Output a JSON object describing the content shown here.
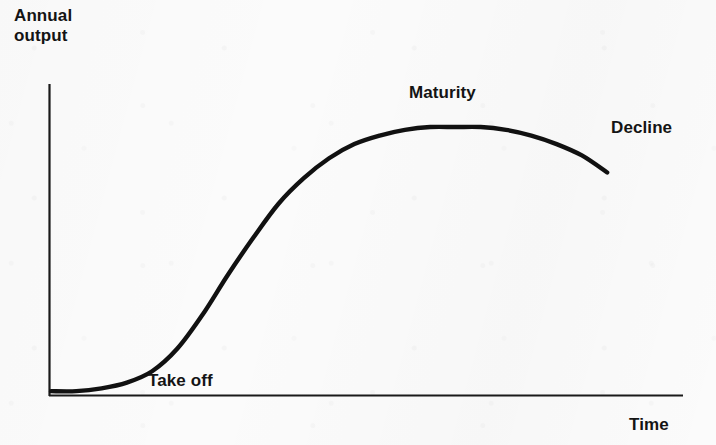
{
  "chart_data": {
    "type": "line",
    "title": "",
    "subtitle": "",
    "xlabel": "Time",
    "ylabel": "Annual output",
    "ylabel_lines": [
      "Annual",
      "output"
    ],
    "grid": false,
    "legend_position": "none",
    "axis_tick_labels": {
      "x": [],
      "y": []
    },
    "xlim": [
      0,
      100
    ],
    "ylim": [
      0,
      100
    ],
    "series": [
      {
        "name": "Product life cycle",
        "color": "#111111",
        "x": [
          0,
          4,
          8,
          12,
          16,
          20,
          24,
          28,
          32,
          36,
          40,
          44,
          48,
          52,
          56,
          60,
          64,
          68,
          72,
          76,
          80,
          84,
          88
        ],
        "y": [
          1,
          1,
          2,
          4,
          8,
          16,
          28,
          42,
          55,
          67,
          76,
          83,
          88,
          91,
          93,
          94,
          94,
          94,
          93,
          91,
          88,
          84,
          78
        ]
      }
    ],
    "annotations": [
      {
        "label": "Take off",
        "stage": "take-off",
        "x": 16,
        "y": 5
      },
      {
        "label": "Maturity",
        "stage": "maturity",
        "x": 57,
        "y": 100
      },
      {
        "label": "Decline",
        "stage": "decline",
        "x": 89,
        "y": 89
      }
    ],
    "colors": {
      "curve": "#111111",
      "axis": "#1a1a1a",
      "text": "#141414",
      "background": "#fbfbfb"
    }
  },
  "labels": {
    "y_axis_line1": "Annual",
    "y_axis_line2": "output",
    "x_axis": "Time",
    "take_off": "Take off",
    "maturity": "Maturity",
    "decline": "Decline"
  }
}
